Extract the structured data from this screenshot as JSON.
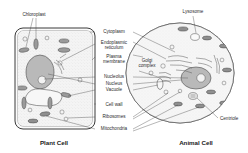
{
  "diagram": {
    "title_plant": "Plant Cell",
    "title_animal": "Animal Cell",
    "labels": {
      "chloroplast": "Chloroplast",
      "cytoplasm": "Cytoplasm",
      "endoplasmic": "Endoplasmic",
      "reticulum": "reticulum",
      "plasma": "Plasma",
      "membrane": "membrane",
      "golgi": "Golgi",
      "complex": "complex",
      "nucleolus": "Nucleolus",
      "nucleus": "Nucleus",
      "vacuole": "Vacuole",
      "cell_wall": "Cell wall",
      "ribosomes": "Ribosomes",
      "mitochondria": "Mitochondria",
      "lysosome": "Lysosome",
      "centriole": "Centriole"
    },
    "colors": {
      "ink": "#2b2b2b",
      "line": "#4a4a4a",
      "nucleus_fill": "#b9b9b9",
      "organelle_fill": "#8f8f8f",
      "cytoplasm_fill": "#f4f4f4",
      "background": "#ffffff"
    }
  }
}
